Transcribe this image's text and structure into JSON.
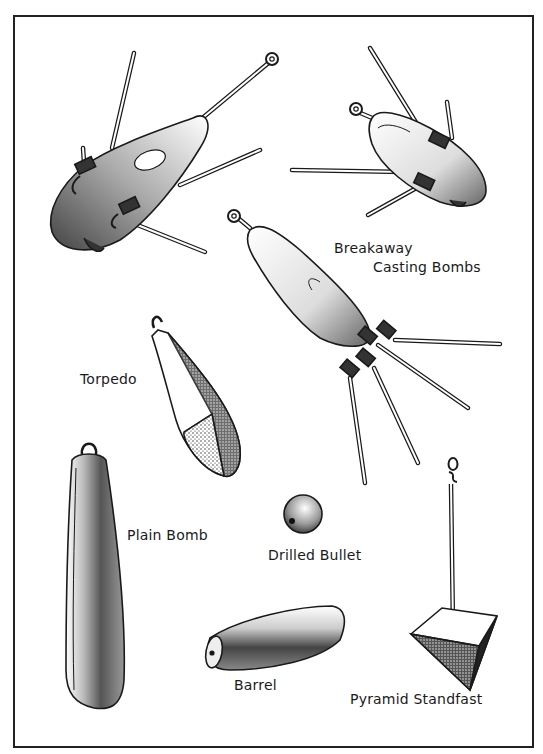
{
  "illustration": {
    "title": "",
    "style": "black-and-white stippled pen illustration of fishing sinkers",
    "colors": {
      "ink": "#1a1a1a",
      "paper": "#ffffff"
    },
    "labels": {
      "breakaway_line1": "Breakaway",
      "breakaway_line2": "Casting Bombs",
      "torpedo": "Torpedo",
      "plain_bomb": "Plain Bomb",
      "drilled_bullet": "Drilled Bullet",
      "barrel": "Barrel",
      "pyramid": "Pyramid Standfast"
    },
    "items": [
      {
        "name": "Breakaway Casting Bomb",
        "count": 3
      },
      {
        "name": "Torpedo"
      },
      {
        "name": "Plain Bomb"
      },
      {
        "name": "Drilled Bullet"
      },
      {
        "name": "Barrel"
      },
      {
        "name": "Pyramid Standfast"
      }
    ]
  }
}
